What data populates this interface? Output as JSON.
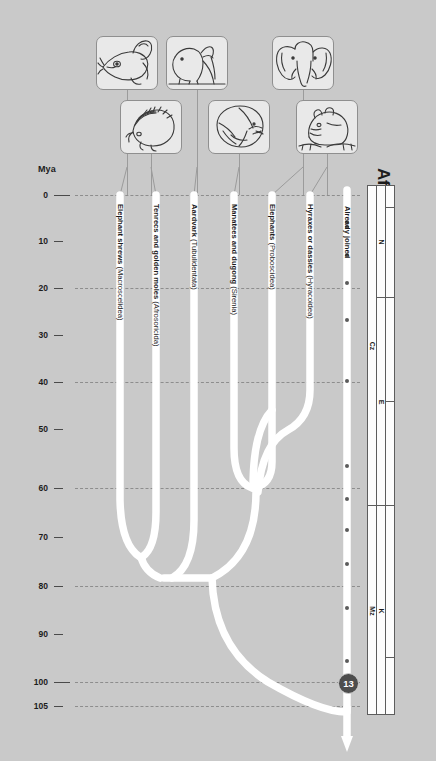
{
  "page": {
    "title": "Afrotheres join",
    "background_color": "#c9c9c9",
    "branch_color": "#ffffff"
  },
  "axis": {
    "unit_label": "Mya",
    "ticks": [
      {
        "label": "0",
        "mya": 0,
        "y": 195,
        "gridline": true,
        "long": true
      },
      {
        "label": "10",
        "mya": 10,
        "y": 241,
        "gridline": false,
        "long": false
      },
      {
        "label": "20",
        "mya": 20,
        "y": 288,
        "gridline": true,
        "long": false
      },
      {
        "label": "30",
        "mya": 30,
        "y": 335,
        "gridline": false,
        "long": false
      },
      {
        "label": "40",
        "mya": 40,
        "y": 382,
        "gridline": true,
        "long": false
      },
      {
        "label": "50",
        "mya": 50,
        "y": 429,
        "gridline": false,
        "long": false
      },
      {
        "label": "60",
        "mya": 60,
        "y": 488,
        "gridline": true,
        "long": false
      },
      {
        "label": "70",
        "mya": 70,
        "y": 537,
        "gridline": false,
        "long": false
      },
      {
        "label": "80",
        "mya": 80,
        "y": 586,
        "gridline": true,
        "long": false
      },
      {
        "label": "90",
        "mya": 90,
        "y": 634,
        "gridline": false,
        "long": false
      },
      {
        "label": "100",
        "mya": 100,
        "y": 682,
        "gridline": true,
        "long": true
      },
      {
        "label": "105",
        "mya": 105,
        "y": 706,
        "gridline": true,
        "long": false
      }
    ]
  },
  "tree": {
    "root_node_label": "13",
    "branches": [
      {
        "id": "macroscelidea",
        "name_bold": "Elephant shrews",
        "name_plain": " (Macroscelidea)",
        "x": 120,
        "top_y": 195,
        "label_y": 204
      },
      {
        "id": "afrosoricida",
        "name_bold": "Tenrecs and golden moles",
        "name_plain": " (Afrosoricida)",
        "x": 156,
        "top_y": 195,
        "label_y": 204
      },
      {
        "id": "tubulidentata",
        "name_bold": "Aardvark",
        "name_plain": " (Tubulidentata)",
        "x": 194,
        "top_y": 195,
        "label_y": 204
      },
      {
        "id": "sirenia",
        "name_bold": "Manatees and dugong",
        "name_plain": " (Sirenia)",
        "x": 234,
        "top_y": 195,
        "label_y": 204
      },
      {
        "id": "proboscidea",
        "name_bold": "Elephants",
        "name_plain": " (Proboscidea)",
        "x": 272,
        "top_y": 195,
        "label_y": 204
      },
      {
        "id": "hyracoidea",
        "name_bold": "Hyraxes or dassies",
        "name_plain": " (Hyracoidea)",
        "x": 310,
        "top_y": 195,
        "label_y": 204
      },
      {
        "id": "already-joined",
        "name_bold": "Already joined",
        "name_plain": "",
        "x": 347,
        "top_y": 190,
        "label_y": 206
      }
    ],
    "joined_dots_y": [
      222,
      227,
      255,
      283,
      320,
      381,
      466,
      499,
      530,
      564,
      608,
      661
    ],
    "node_badge": {
      "label": "13",
      "x": 338,
      "y": 673
    }
  },
  "pictures": [
    {
      "id": "elephant-shrew-pic",
      "icon": "elephant-shrew-icon",
      "x": 96,
      "y": 36,
      "w": 62,
      "h": 54,
      "branch_x": 120,
      "leader_from_y": 90,
      "leader_to_y": 195
    },
    {
      "id": "tenrec-pic",
      "icon": "tenrec-icon",
      "x": 120,
      "y": 100,
      "w": 62,
      "h": 54,
      "branch_x": 156,
      "leader_from_y": 154,
      "leader_to_y": 195
    },
    {
      "id": "aardvark-pic",
      "icon": "aardvark-icon",
      "x": 166,
      "y": 36,
      "w": 62,
      "h": 54,
      "branch_x": 194,
      "leader_from_y": 90,
      "leader_to_y": 195
    },
    {
      "id": "manatee-pic",
      "icon": "manatee-icon",
      "x": 208,
      "y": 100,
      "w": 62,
      "h": 54,
      "branch_x": 234,
      "leader_from_y": 154,
      "leader_to_y": 195
    },
    {
      "id": "elephant-pic",
      "icon": "elephant-icon",
      "x": 272,
      "y": 36,
      "w": 62,
      "h": 54,
      "branch_x": 272,
      "leader_from_y": 90,
      "leader_to_y": 195
    },
    {
      "id": "hyrax-pic",
      "icon": "hyrax-icon",
      "x": 296,
      "y": 100,
      "w": 62,
      "h": 54,
      "branch_x": 310,
      "leader_from_y": 154,
      "leader_to_y": 195
    }
  ],
  "geo_scale": {
    "eras": [
      {
        "label": "Cz",
        "top": 0,
        "height": 320
      },
      {
        "label": "Mz",
        "top": 320,
        "height": 210
      }
    ],
    "periods": [
      {
        "label": "N",
        "top": 0,
        "height": 112
      },
      {
        "label": "E",
        "top": 112,
        "height": 208
      },
      {
        "label": "K",
        "top": 320,
        "height": 210
      }
    ],
    "epochs": [
      {
        "label": "",
        "top": 0,
        "height": 22
      },
      {
        "label": "",
        "top": 22,
        "height": 90
      },
      {
        "label": "",
        "top": 112,
        "height": 104
      },
      {
        "label": "",
        "top": 216,
        "height": 104
      },
      {
        "label": "",
        "top": 320,
        "height": 152
      },
      {
        "label": "",
        "top": 472,
        "height": 58
      }
    ]
  }
}
